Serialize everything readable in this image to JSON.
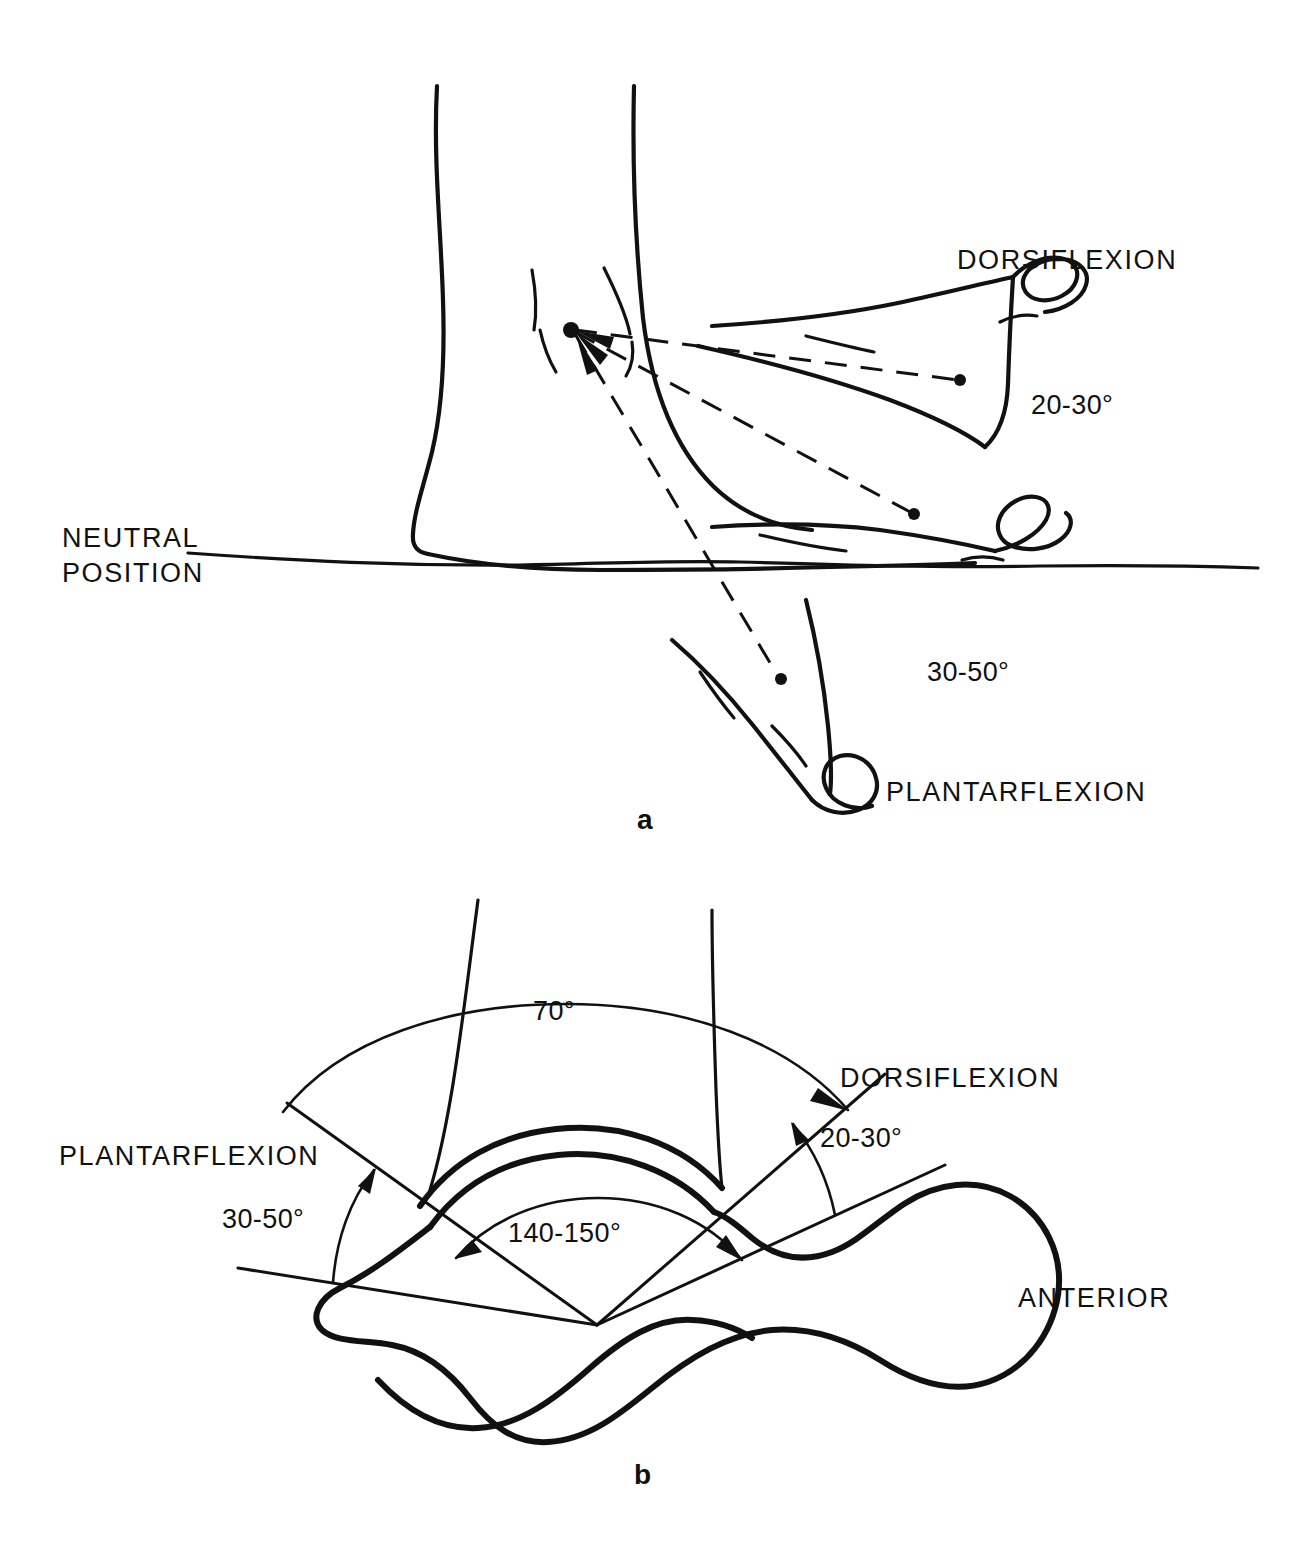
{
  "figure": {
    "ink_color": "#111111",
    "background_color": "#ffffff"
  },
  "panels": [
    {
      "letter": "a",
      "view": "lateral",
      "labels": {
        "dorsiflexion": "DORSIFLEXION",
        "dorsiflexion_angle": "20-30",
        "neutral_line_1": "NEUTRAL",
        "neutral_line_2": "POSITION",
        "plantarflexion_angle": "30-50",
        "plantarflexion": "PLANTARFLEXION"
      }
    },
    {
      "letter": "b",
      "view": "superior",
      "labels": {
        "total_arc_angle": "70",
        "dorsiflexion": "DORSIFLEXION",
        "dorsiflexion_angle": "20-30",
        "plantarflexion": "PLANTARFLEXION",
        "plantarflexion_angle": "30-50",
        "talar_dome_angle": "140-150",
        "anterior": "ANTERIOR"
      }
    }
  ],
  "symbols": {
    "degree": "°"
  },
  "measurements": {
    "dorsiflexion_range_deg": "20-30",
    "plantarflexion_range_deg": "30-50",
    "total_sagittal_arc_deg": "70",
    "talar_dome_arc_deg": "140-150"
  }
}
